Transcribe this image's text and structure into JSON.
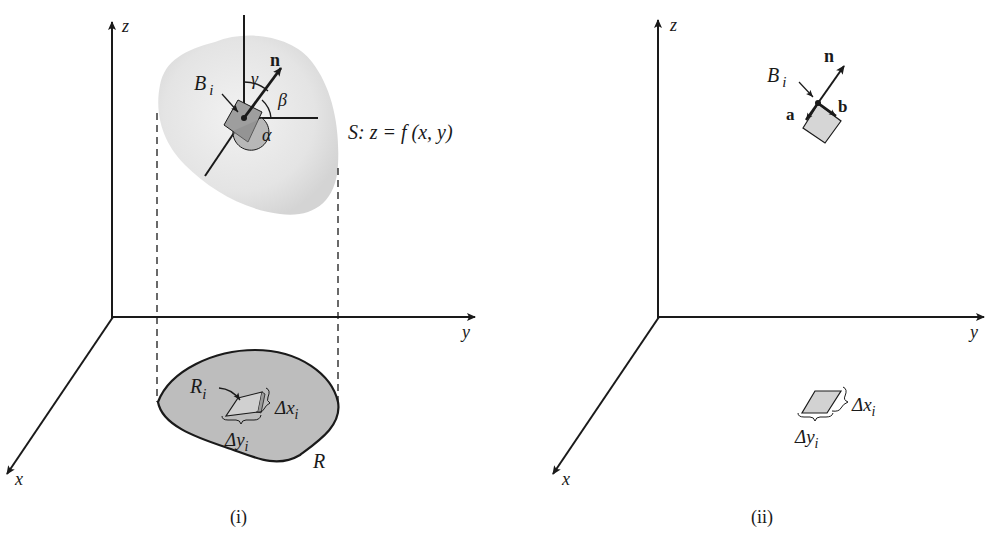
{
  "panels": [
    {
      "id": "i",
      "caption": "(i)",
      "axes": {
        "x": "x",
        "y": "y",
        "z": "z"
      },
      "surface_label": "S: z = f (x, y)",
      "surface_label_parts": {
        "S": "S",
        "rest": ": z = f (x, y)"
      },
      "patch_label": {
        "main": "B",
        "sub": "i"
      },
      "normal_label": "n",
      "angles": {
        "alpha": "α",
        "beta": "β",
        "gamma": "γ"
      },
      "region_label": "R",
      "subregion_label": {
        "main": "R",
        "sub": "i"
      },
      "dx_label": {
        "main": "Δx",
        "sub": "i"
      },
      "dy_label": {
        "main": "Δy",
        "sub": "i"
      }
    },
    {
      "id": "ii",
      "caption": "(ii)",
      "axes": {
        "x": "x",
        "y": "y",
        "z": "z"
      },
      "patch_label": {
        "main": "B",
        "sub": "i"
      },
      "normal_label": "n",
      "vector_a": "a",
      "vector_b": "b",
      "dx_label": {
        "main": "Δx",
        "sub": "i"
      },
      "dy_label": {
        "main": "Δy",
        "sub": "i"
      }
    }
  ],
  "colors": {
    "ink": "#1a1a1a",
    "surface_fill": "#e6e6e6",
    "region_fill": "#bdbdbd",
    "patch_fill": "#a8a8a8",
    "light_patch_fill": "#d6d6d6"
  }
}
